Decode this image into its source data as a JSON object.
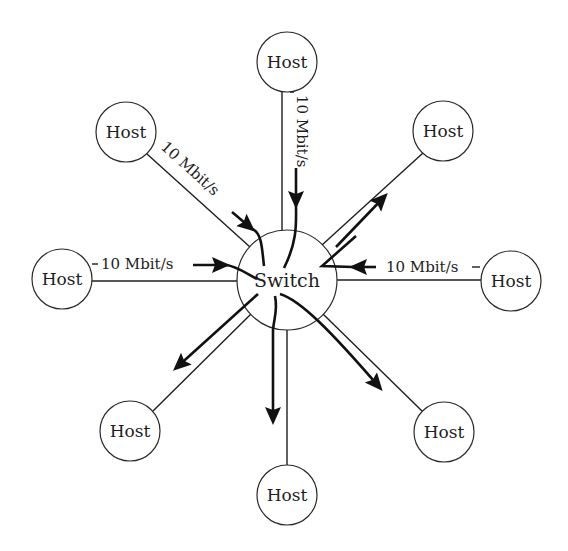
{
  "diagram": {
    "type": "star-topology",
    "switch": {
      "label": "Switch"
    },
    "hosts": [
      {
        "id": "top",
        "label": "Host"
      },
      {
        "id": "top-left",
        "label": "Host"
      },
      {
        "id": "top-right",
        "label": "Host"
      },
      {
        "id": "left",
        "label": "Host"
      },
      {
        "id": "right",
        "label": "Host"
      },
      {
        "id": "bottom-left",
        "label": "Host"
      },
      {
        "id": "bottom",
        "label": "Host"
      },
      {
        "id": "bottom-right",
        "label": "Host"
      }
    ],
    "link_rates": {
      "top": "10 Mbit/s",
      "top_left": "10 Mbit/s",
      "left": "10 Mbit/s",
      "right": "10 Mbit/s"
    },
    "flows": [
      {
        "from": "top",
        "to": "switch",
        "direction": "inbound"
      },
      {
        "from": "top-left",
        "to": "switch",
        "direction": "inbound"
      },
      {
        "from": "left",
        "to": "switch",
        "direction": "inbound"
      },
      {
        "from": "right",
        "to": "switch",
        "direction": "inbound"
      },
      {
        "from": "switch",
        "to": "top-right",
        "direction": "outbound"
      },
      {
        "from": "switch",
        "to": "bottom-left",
        "direction": "outbound"
      },
      {
        "from": "switch",
        "to": "bottom",
        "direction": "outbound"
      },
      {
        "from": "switch",
        "to": "bottom-right",
        "direction": "outbound"
      }
    ],
    "colors": {
      "stroke": "#1e1e1e",
      "background": "#ffffff"
    }
  }
}
